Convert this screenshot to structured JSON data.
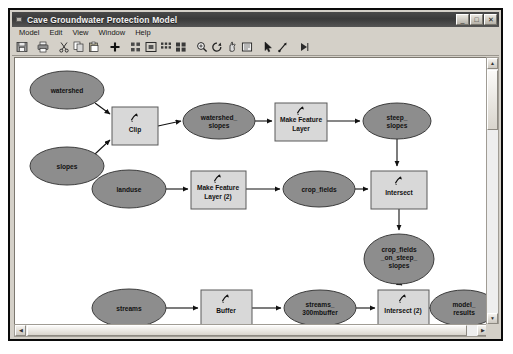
{
  "window": {
    "title": "Cave Groundwater Protection Model",
    "icon": "model-window-icon",
    "buttons": {
      "minimize": "_",
      "maximize": "□",
      "close": "✕"
    }
  },
  "menubar": {
    "items": [
      {
        "label": "Model"
      },
      {
        "label": "Edit"
      },
      {
        "label": "View"
      },
      {
        "label": "Window"
      },
      {
        "label": "Help"
      }
    ]
  },
  "toolbar": {
    "items": [
      {
        "name": "save-icon",
        "title": "Save"
      },
      {
        "name": "print-icon",
        "title": "Print"
      },
      {
        "name": "cut-icon",
        "title": "Cut"
      },
      {
        "name": "copy-icon",
        "title": "Copy"
      },
      {
        "name": "paste-icon",
        "title": "Paste"
      },
      {
        "name": "add-data-icon",
        "title": "Add Data"
      },
      {
        "name": "auto-layout-icon",
        "title": "Auto Layout"
      },
      {
        "name": "fit-to-window-icon",
        "title": "Full Extent"
      },
      {
        "name": "diagram-properties-icon",
        "title": "Diagram Properties"
      },
      {
        "name": "select-all-icon",
        "title": "Select All"
      },
      {
        "name": "zoom-in-icon",
        "title": "Zoom In"
      },
      {
        "name": "zoom-out-icon",
        "title": "Zoom Out"
      },
      {
        "name": "pan-icon",
        "title": "Pan"
      },
      {
        "name": "zoom-whole-page-icon",
        "title": "Zoom Whole Page"
      },
      {
        "name": "select-pointer-icon",
        "title": "Select"
      },
      {
        "name": "connect-icon",
        "title": "Connect"
      },
      {
        "name": "run-icon",
        "title": "Run"
      }
    ]
  },
  "model": {
    "variables": [
      {
        "id": "watershed",
        "label": "watershed",
        "cx": 52,
        "cy": 32,
        "rx": 37,
        "ry": 19,
        "lines": [
          "watershed"
        ]
      },
      {
        "id": "slopes",
        "label": "slopes",
        "cx": 52,
        "cy": 108,
        "rx": 37,
        "ry": 19,
        "lines": [
          "slopes"
        ]
      },
      {
        "id": "watershed_slopes",
        "label": "watershed_slopes",
        "cx": 204,
        "cy": 63,
        "rx": 36,
        "ry": 18,
        "lines": [
          "watershed_",
          "slopes"
        ]
      },
      {
        "id": "steep_slopes",
        "label": "steep_slopes",
        "cx": 382,
        "cy": 63,
        "rx": 34,
        "ry": 18,
        "lines": [
          "steep_",
          "slopes"
        ]
      },
      {
        "id": "landuse",
        "label": "landuse",
        "cx": 114,
        "cy": 131,
        "rx": 37,
        "ry": 19,
        "lines": [
          "landuse"
        ]
      },
      {
        "id": "crop_fields",
        "label": "crop_fields",
        "cx": 304,
        "cy": 131,
        "rx": 36,
        "ry": 18,
        "lines": [
          "crop_fields"
        ]
      },
      {
        "id": "crop_fields_on_steep_slopes",
        "label": "crop_fields_on_steep_slopes",
        "cx": 384,
        "cy": 201,
        "rx": 35,
        "ry": 25,
        "lines": [
          "crop_fields",
          "_on_steep_",
          "slopes"
        ]
      },
      {
        "id": "streams",
        "label": "streams",
        "cx": 114,
        "cy": 250,
        "rx": 37,
        "ry": 19,
        "lines": [
          "streams"
        ]
      },
      {
        "id": "streams_300mbuffer",
        "label": "streams_300mbuffer",
        "cx": 305,
        "cy": 250,
        "rx": 36,
        "ry": 18,
        "lines": [
          "streams_",
          "300mbuffer"
        ]
      },
      {
        "id": "model_results",
        "label": "model_results",
        "cx": 449,
        "cy": 250,
        "rx": 34,
        "ry": 18,
        "lines": [
          "model_",
          "results"
        ]
      }
    ],
    "processes": [
      {
        "id": "clip",
        "label": "Clip",
        "x": 97,
        "y": 49,
        "w": 46,
        "h": 38,
        "lines": [
          "Clip"
        ]
      },
      {
        "id": "make_feature_layer",
        "label": "Make Feature Layer",
        "x": 260,
        "y": 45,
        "w": 52,
        "h": 38,
        "lines": [
          "Make Feature",
          "Layer"
        ]
      },
      {
        "id": "make_feature_layer_2",
        "label": "Make Feature Layer (2)",
        "x": 176,
        "y": 113,
        "w": 55,
        "h": 38,
        "lines": [
          "Make Feature",
          "Layer (2)"
        ]
      },
      {
        "id": "intersect",
        "label": "Intersect",
        "x": 356,
        "y": 113,
        "w": 56,
        "h": 38,
        "lines": [
          "Intersect"
        ]
      },
      {
        "id": "buffer",
        "label": "Buffer",
        "x": 186,
        "y": 232,
        "w": 51,
        "h": 37,
        "lines": [
          "Buffer"
        ]
      },
      {
        "id": "intersect_2",
        "label": "Intersect (2)",
        "x": 363,
        "y": 232,
        "w": 51,
        "h": 37,
        "lines": [
          "Intersect (2)"
        ]
      }
    ],
    "connections": [
      {
        "from": "watershed",
        "to": "clip"
      },
      {
        "from": "slopes",
        "to": "clip"
      },
      {
        "from": "clip",
        "to": "watershed_slopes"
      },
      {
        "from": "watershed_slopes",
        "to": "make_feature_layer"
      },
      {
        "from": "make_feature_layer",
        "to": "steep_slopes"
      },
      {
        "from": "steep_slopes",
        "to": "intersect"
      },
      {
        "from": "landuse",
        "to": "make_feature_layer_2"
      },
      {
        "from": "make_feature_layer_2",
        "to": "crop_fields"
      },
      {
        "from": "crop_fields",
        "to": "intersect"
      },
      {
        "from": "intersect",
        "to": "crop_fields_on_steep_slopes"
      },
      {
        "from": "crop_fields_on_steep_slopes",
        "to": "intersect_2"
      },
      {
        "from": "streams",
        "to": "buffer"
      },
      {
        "from": "buffer",
        "to": "streams_300mbuffer"
      },
      {
        "from": "streams_300mbuffer",
        "to": "intersect_2"
      },
      {
        "from": "intersect_2",
        "to": "model_results"
      }
    ],
    "colors": {
      "variable_fill": "#8d8d8d",
      "variable_stroke": "#3d3d3d",
      "process_fill": "#d8d8d8",
      "process_stroke": "#5a5a5a",
      "connector": "#1a1a1a",
      "canvas": "#ffffff"
    }
  },
  "scrollbars": {
    "vertical": {
      "up": "▲",
      "down": "▼"
    },
    "horizontal": {
      "left": "◀",
      "right": "▶"
    }
  }
}
